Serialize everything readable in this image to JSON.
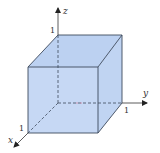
{
  "diagram": {
    "axes": {
      "x": {
        "label": "x",
        "tick": "1"
      },
      "y": {
        "label": "y",
        "tick": "1"
      },
      "z": {
        "label": "z",
        "tick": "1"
      }
    },
    "colors": {
      "face_fill": "#c3d6f3",
      "face_fill_top": "#bcd1f1",
      "edge": "#3d4a5c",
      "axis": "#333333",
      "hidden_dash": "#3d4a5c",
      "dash_accent": "#d08aa8"
    }
  }
}
